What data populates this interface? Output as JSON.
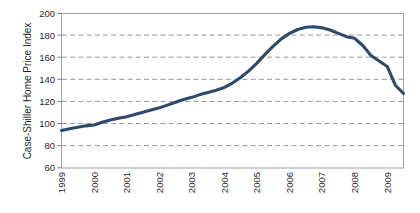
{
  "chart_data": {
    "type": "line",
    "title": "",
    "xlabel": "",
    "ylabel": "Case-Shiller Home Price Index",
    "xlim": [
      1999.0,
      2009.5
    ],
    "ylim": [
      60,
      200
    ],
    "grid": true,
    "legend": null,
    "legend_position": "none",
    "line_color": "#2c4a6e",
    "x_tick_labels": [
      "1999",
      "2000",
      "2001",
      "2002",
      "2003",
      "2004",
      "2005",
      "2006",
      "2007",
      "2008",
      "2009"
    ],
    "y_tick_labels": [
      "60",
      "80",
      "100",
      "120",
      "140",
      "160",
      "180",
      "200"
    ],
    "y_ticks": [
      60,
      80,
      100,
      120,
      140,
      160,
      180,
      200
    ],
    "x_ticks": [
      1999,
      2000,
      2001,
      2002,
      2003,
      2004,
      2005,
      2006,
      2007,
      2008,
      2009
    ],
    "series": [
      {
        "name": "Case-Shiller Home Price Index",
        "x": [
          1999.0,
          1999.25,
          1999.5,
          1999.75,
          2000.0,
          2000.25,
          2000.5,
          2000.75,
          2001.0,
          2001.25,
          2001.5,
          2001.75,
          2002.0,
          2002.25,
          2002.5,
          2002.75,
          2003.0,
          2003.25,
          2003.5,
          2003.75,
          2004.0,
          2004.25,
          2004.5,
          2004.75,
          2005.0,
          2005.25,
          2005.5,
          2005.75,
          2006.0,
          2006.25,
          2006.5,
          2006.75,
          2007.0,
          2007.25,
          2007.5,
          2007.75,
          2008.0,
          2008.25,
          2008.5,
          2008.75,
          2009.0,
          2009.25,
          2009.5
        ],
        "y": [
          94.0,
          95.5,
          97.0,
          98.2,
          99.0,
          101.5,
          103.5,
          105.0,
          106.5,
          108.5,
          110.5,
          112.5,
          114.5,
          117.0,
          119.5,
          122.0,
          124.0,
          126.5,
          128.5,
          130.5,
          133.0,
          137.0,
          142.0,
          148.0,
          155.0,
          163.0,
          170.5,
          177.0,
          182.0,
          185.5,
          187.5,
          188.0,
          187.0,
          185.0,
          182.0,
          179.0,
          177.5,
          171.0,
          162.0,
          157.0,
          152.0,
          135.0,
          127.5
        ]
      }
    ],
    "annotations": []
  }
}
